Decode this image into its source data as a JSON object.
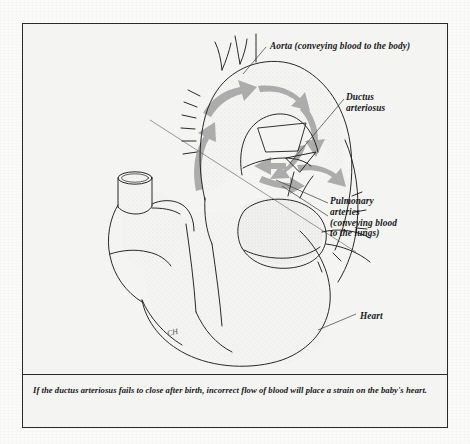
{
  "figure": {
    "type": "anatomical-diagram",
    "background_color": "#f4f4f2",
    "frame_color": "#2b2b2b",
    "ink_color": "#1d1d1d",
    "arrow_color": "#a9a9a9"
  },
  "labels": {
    "aorta": "Aorta (conveying blood to the body)",
    "ductus_arteriosus": "Ductus\narteriosus",
    "pulmonary_arteries": "Pulmonary\narteries\n(conveying blood\nto the lungs)",
    "heart": "Heart"
  },
  "caption": {
    "text": "If the ductus arteriosus fails to close after birth, incorrect flow of blood will place a strain on the baby's heart."
  },
  "artist_mark": {
    "text": "CH"
  }
}
